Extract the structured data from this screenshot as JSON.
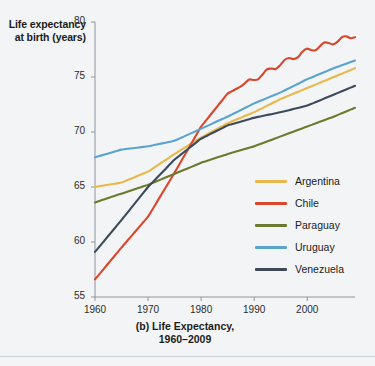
{
  "chart_data": {
    "type": "line",
    "title": "(b) Life Expectancy,",
    "subtitle": "1960–2009",
    "ylabel_line1": "Life expectancy",
    "ylabel_line2": "at birth (years)",
    "xlabel": "",
    "xlim": [
      1960,
      2009
    ],
    "ylim": [
      55,
      80
    ],
    "xticks": [
      1960,
      1970,
      1980,
      1990,
      2000
    ],
    "xtick_labels": [
      "1960",
      "1970",
      "1980",
      "1990",
      "2000"
    ],
    "yticks": [
      55,
      60,
      65,
      70,
      75,
      80
    ],
    "ytick_labels": [
      "55",
      "60",
      "65",
      "70",
      "75",
      "80"
    ],
    "grid": false,
    "legend_position": "right-inside",
    "x": [
      1960,
      1965,
      1970,
      1975,
      1980,
      1985,
      1990,
      1995,
      2000,
      2005,
      2009
    ],
    "series": [
      {
        "name": "Argentina",
        "color": "#e8b84b",
        "values": [
          65.0,
          65.4,
          66.4,
          68.0,
          69.5,
          70.8,
          71.8,
          73.0,
          74.0,
          75.0,
          75.8
        ]
      },
      {
        "name": "Chile",
        "color": "#d9472b",
        "values": [
          56.6,
          59.5,
          62.3,
          66.3,
          70.5,
          73.5,
          74.8,
          76.2,
          77.4,
          78.2,
          78.8
        ]
      },
      {
        "name": "Paraguay",
        "color": "#6b7a2e",
        "values": [
          63.6,
          64.4,
          65.2,
          66.2,
          67.2,
          68.0,
          68.7,
          69.6,
          70.5,
          71.4,
          72.2
        ]
      },
      {
        "name": "Uruguay",
        "color": "#5ba3cf",
        "values": [
          67.7,
          68.4,
          68.7,
          69.2,
          70.3,
          71.4,
          72.6,
          73.6,
          74.8,
          75.8,
          76.5
        ]
      },
      {
        "name": "Venezuela",
        "color": "#3c4a5c",
        "values": [
          59.1,
          62.0,
          65.0,
          67.5,
          69.4,
          70.6,
          71.3,
          71.8,
          72.4,
          73.4,
          74.2
        ]
      }
    ],
    "legend_entries": [
      "Argentina",
      "Chile",
      "Paraguay",
      "Uruguay",
      "Venezuela"
    ]
  }
}
